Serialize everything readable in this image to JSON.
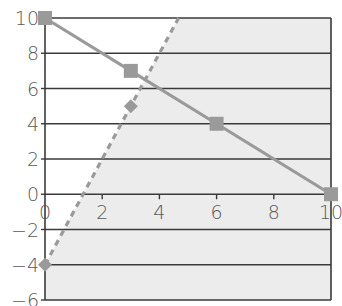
{
  "chart_data": {
    "type": "line",
    "title": "",
    "xlabel": "",
    "ylabel": "",
    "xlim": [
      0,
      10
    ],
    "ylim": [
      -6,
      10
    ],
    "x_ticks": [
      0,
      2,
      4,
      6,
      8,
      10
    ],
    "x_tick_labels": [
      "0",
      "2",
      "4",
      "6",
      "8",
      "10"
    ],
    "y_ticks": [
      -6,
      -4,
      -2,
      0,
      2,
      4,
      6,
      8,
      10
    ],
    "y_tick_labels": [
      "−6",
      "−4",
      "−2",
      "0",
      "2",
      "4",
      "6",
      "8",
      "10"
    ],
    "grid": "horizontal",
    "legend": null,
    "series": [
      {
        "name": "solid line",
        "style": "solid",
        "marker": "square",
        "color": "#9a9a9a",
        "x": [
          0,
          3,
          6,
          10
        ],
        "y": [
          10,
          7,
          4,
          0
        ]
      },
      {
        "name": "dashed line",
        "style": "dashed",
        "marker": "diamond",
        "color": "#9a9a9a",
        "x": [
          0,
          3,
          4.67
        ],
        "y": [
          -4,
          5,
          10
        ]
      }
    ],
    "shaded_region": {
      "description": "region to the right of / below the dashed line (y <= 3x - 4)",
      "color": "#ececec"
    }
  },
  "colors": {
    "axis": "#3a3a3a",
    "grid": "#3a3a3a",
    "series": "#9a9a9a",
    "shade": "#ececec",
    "label": "#5a5a5a"
  }
}
